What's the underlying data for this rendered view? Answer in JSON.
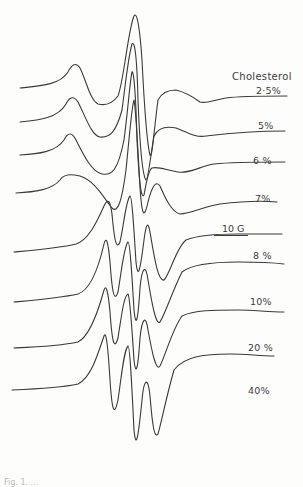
{
  "figure": {
    "type": "stacked ESR spectra",
    "header": "Cholesterol",
    "scale_bar_label": "10 G",
    "caption_fragment": "Fig. 1. ..."
  },
  "chart_data": {
    "type": "line",
    "xlabel": "Magnetic field (scale bar: 10 G)",
    "ylabel": "",
    "legend_title": "Cholesterol",
    "series": [
      {
        "name": "2.5%",
        "label": "2·5%",
        "baseline_y": 88
      },
      {
        "name": "5%",
        "label": "5%",
        "baseline_y": 122
      },
      {
        "name": "6%",
        "label": "6 %",
        "baseline_y": 155
      },
      {
        "name": "7%",
        "label": "7%",
        "baseline_y": 193
      },
      {
        "name": "8%",
        "label": "8 %",
        "baseline_y": 252
      },
      {
        "name": "10%",
        "label": "10%",
        "baseline_y": 302
      },
      {
        "name": "20%",
        "label": "20 %",
        "baseline_y": 348
      },
      {
        "name": "40%",
        "label": "40%",
        "baseline_y": 390
      }
    ],
    "grid": false,
    "legend_position": "right, inline labels"
  },
  "labels": {
    "s0": "2·5%",
    "s1": "5%",
    "s2": "6 %",
    "s3": "7%",
    "s4": "8 %",
    "s5": "10%",
    "s6": "20 %",
    "s7": "40%"
  }
}
